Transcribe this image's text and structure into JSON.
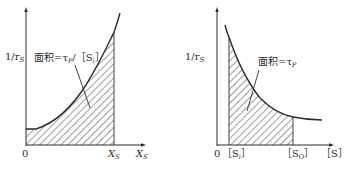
{
  "diagrams": [
    {
      "id": "left",
      "y_axis_label": "1/r",
      "y_axis_label_sub": "S",
      "x_axis_label": "X",
      "x_axis_label_sub": "S",
      "origin_label": "0",
      "x_marker_label": "X",
      "x_marker_label_sub": "S",
      "area_label_prefix": "面积=τ",
      "area_label_sub": "P",
      "area_label_suffix": "/［S",
      "area_label_suffix_sub": "i",
      "area_label_end": "］",
      "curve": "increasing (convex, starts flat then rises steeply)",
      "shaded_region": "from 0 to X_S under curve"
    },
    {
      "id": "right",
      "y_axis_label": "1/r",
      "y_axis_label_sub": "S",
      "x_axis_label": "［S］",
      "origin_label": "0",
      "x_marker_left_label": "［S",
      "x_marker_left_sub": "i",
      "x_marker_left_end": "］",
      "x_marker_right_label": "［S",
      "x_marker_right_sub": "O",
      "x_marker_right_end": "］",
      "area_label_prefix": "面积=τ",
      "area_label_sub": "P",
      "curve": "decreasing (hyperbolic decay)",
      "shaded_region": "from [S_i] to [S_O] under curve"
    }
  ],
  "colors": {
    "line": "#2a2a2a",
    "hatch": "#3a3a3a",
    "background": "#ffffff"
  }
}
